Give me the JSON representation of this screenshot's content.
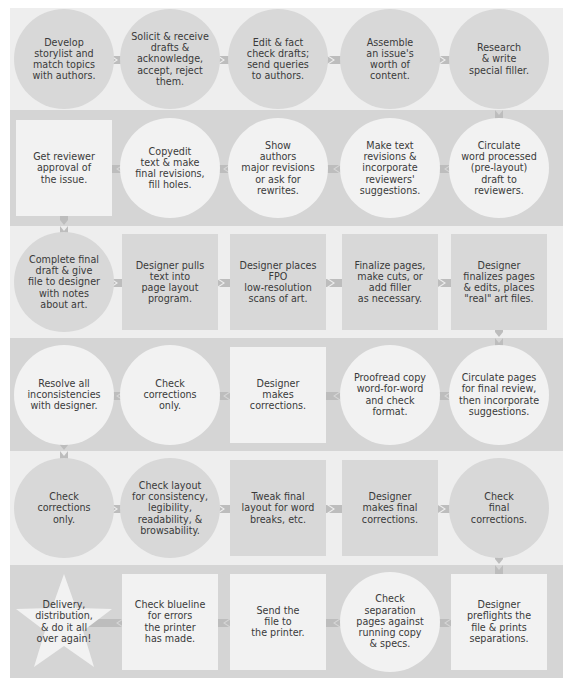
{
  "diagram": {
    "colors": {
      "light_band": "#eeeeee",
      "dark_band": "#d5d5d5",
      "node_on_light": "#d8d8d8",
      "node_on_dark": "#f2f2f2",
      "arrow": "#bdbdbd",
      "text": "#3a3a3a"
    },
    "rows": [
      {
        "direction": "right",
        "band": "light",
        "nodes": [
          {
            "shape": "circle",
            "label": "Develop\nstorylist and\nmatch topics\nwith authors."
          },
          {
            "shape": "circle",
            "label": "Solicit & receive\ndrafts &\nacknowledge,\naccept, reject\nthem."
          },
          {
            "shape": "circle",
            "label": "Edit & fact\ncheck drafts;\nsend queries\nto authors."
          },
          {
            "shape": "circle",
            "label": "Assemble\nan issue's\nworth of\ncontent."
          },
          {
            "shape": "circle",
            "label": "Research\n& write\nspecial filler."
          }
        ]
      },
      {
        "direction": "left",
        "band": "dark",
        "nodes": [
          {
            "shape": "square",
            "label": "Get reviewer\napproval of\nthe issue."
          },
          {
            "shape": "circle",
            "label": "Copyedit\ntext & make\nfinal revisions,\nfill holes."
          },
          {
            "shape": "circle",
            "label": "Show\nauthors\nmajor revisions\nor ask for\nrewrites."
          },
          {
            "shape": "circle",
            "label": "Make text\nrevisions &\nincorporate\nreviewers'\nsuggestions."
          },
          {
            "shape": "circle",
            "label": "Circulate\nword processed\n(pre-layout)\ndraft to\nreviewers."
          }
        ]
      },
      {
        "direction": "right",
        "band": "light",
        "nodes": [
          {
            "shape": "circle",
            "label": "Complete final\ndraft & give\nfile to designer\nwith notes\nabout art."
          },
          {
            "shape": "square",
            "label": "Designer pulls\ntext into\npage layout\nprogram."
          },
          {
            "shape": "square",
            "label": "Designer places\nFPO\nlow-resolution\nscans of art."
          },
          {
            "shape": "square",
            "label": "Finalize pages,\nmake cuts, or\nadd filler\nas necessary."
          },
          {
            "shape": "square",
            "label": "Designer\nfinalizes pages\n& edits, places\n\"real\" art files."
          }
        ]
      },
      {
        "direction": "left",
        "band": "dark",
        "nodes": [
          {
            "shape": "circle",
            "label": "Resolve all\ninconsistencies\nwith designer."
          },
          {
            "shape": "circle",
            "label": "Check\ncorrections\nonly."
          },
          {
            "shape": "square",
            "label": "Designer\nmakes\ncorrections."
          },
          {
            "shape": "circle",
            "label": "Proofread copy\nword-for-word\nand check\nformat."
          },
          {
            "shape": "circle",
            "label": "Circulate pages\nfor final review,\nthen incorporate\nsuggestions."
          }
        ]
      },
      {
        "direction": "right",
        "band": "light",
        "nodes": [
          {
            "shape": "circle",
            "label": "Check\ncorrections\nonly."
          },
          {
            "shape": "circle",
            "label": "Check layout\nfor consistency,\nlegibility,\nreadability, &\nbrowsability."
          },
          {
            "shape": "square",
            "label": "Tweak final\nlayout for word\nbreaks, etc."
          },
          {
            "shape": "square",
            "label": "Designer\nmakes final\ncorrections."
          },
          {
            "shape": "circle",
            "label": "Check\nfinal\ncorrections."
          }
        ]
      },
      {
        "direction": "left",
        "band": "dark",
        "nodes": [
          {
            "shape": "star",
            "label": "Delivery,\ndistribution,\n& do it all\nover again!"
          },
          {
            "shape": "square",
            "label": "Check blueline\nfor errors\nthe printer\nhas made."
          },
          {
            "shape": "square",
            "label": "Send the\nfile to\nthe printer."
          },
          {
            "shape": "circle",
            "label": "Check\nseparation\npages against\nrunning copy\n& specs."
          },
          {
            "shape": "square",
            "label": "Designer\npreflights the\nfile & prints\nseparations."
          }
        ]
      }
    ]
  }
}
